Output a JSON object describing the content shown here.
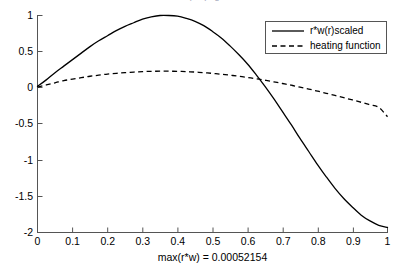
{
  "figure": {
    "title_clipped": "max(r*w) figure",
    "background_color": "#ffffff",
    "axis_color": "#555555",
    "curve_color": "#000000"
  },
  "legend": {
    "position": "top-right",
    "entries": [
      {
        "label": "r*w(r)scaled",
        "style": "solid"
      },
      {
        "label": "heating function",
        "style": "dashed"
      }
    ]
  },
  "chart_data": {
    "type": "line",
    "title": "",
    "xlabel": "max(r*w) = 0.00052154",
    "ylabel": "",
    "xlim": [
      0,
      1
    ],
    "ylim": [
      -2,
      1
    ],
    "grid": false,
    "legend_position": "upper right",
    "xticks": [
      0,
      0.1,
      0.2,
      0.3,
      0.4,
      0.5,
      0.6,
      0.7,
      0.8,
      0.9,
      1
    ],
    "xtick_labels": [
      "0",
      "0.1",
      "0.2",
      "0.3",
      "0.4",
      "0.5",
      "0.6",
      "0.7",
      "0.8",
      "0.9",
      "1"
    ],
    "yticks": [
      1,
      0.5,
      0,
      -0.5,
      -1,
      -1.5,
      -2
    ],
    "ytick_labels": [
      "1",
      "0.5",
      "0",
      "-0.5",
      "-1",
      "-1.5",
      "-2"
    ],
    "x": [
      0,
      0.025,
      0.05,
      0.075,
      0.1,
      0.125,
      0.15,
      0.175,
      0.2,
      0.225,
      0.25,
      0.275,
      0.3,
      0.325,
      0.35,
      0.375,
      0.4,
      0.425,
      0.45,
      0.475,
      0.5,
      0.525,
      0.55,
      0.575,
      0.6,
      0.625,
      0.65,
      0.675,
      0.7,
      0.725,
      0.75,
      0.775,
      0.8,
      0.825,
      0.85,
      0.875,
      0.9,
      0.925,
      0.95,
      0.975,
      1
    ],
    "series": [
      {
        "name": "r*w(r)scaled",
        "style": "solid",
        "color": "#000000",
        "values": [
          0.02,
          0.11,
          0.21,
          0.3,
          0.39,
          0.48,
          0.57,
          0.65,
          0.72,
          0.79,
          0.85,
          0.9,
          0.95,
          0.98,
          1.0,
          1.0,
          0.99,
          0.96,
          0.92,
          0.86,
          0.78,
          0.69,
          0.58,
          0.46,
          0.33,
          0.18,
          0.02,
          -0.15,
          -0.33,
          -0.51,
          -0.7,
          -0.88,
          -1.06,
          -1.23,
          -1.39,
          -1.53,
          -1.65,
          -1.76,
          -1.84,
          -1.9,
          -1.93
        ]
      },
      {
        "name": "heating function",
        "style": "dashed",
        "color": "#000000",
        "values": [
          0.01,
          0.04,
          0.07,
          0.1,
          0.12,
          0.14,
          0.16,
          0.175,
          0.19,
          0.2,
          0.21,
          0.218,
          0.224,
          0.228,
          0.23,
          0.23,
          0.228,
          0.224,
          0.218,
          0.21,
          0.2,
          0.188,
          0.175,
          0.16,
          0.143,
          0.125,
          0.105,
          0.083,
          0.06,
          0.036,
          0.01,
          -0.017,
          -0.045,
          -0.075,
          -0.105,
          -0.136,
          -0.168,
          -0.2,
          -0.235,
          -0.27,
          -0.4
        ]
      }
    ],
    "annotations": [
      {
        "text": "curves cross near x = 0.625, y = 0"
      }
    ]
  }
}
